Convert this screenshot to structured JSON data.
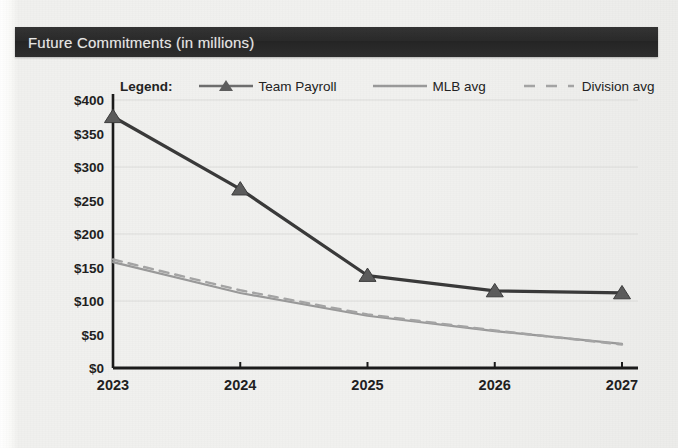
{
  "header": {
    "title": "Future Commitments (in millions)"
  },
  "legend": {
    "label": "Legend:",
    "items": [
      {
        "name": "Team Payroll",
        "style": "line-marker",
        "color": "#3a3a3a"
      },
      {
        "name": "MLB avg",
        "style": "solid",
        "color": "#9a9a9a"
      },
      {
        "name": "Division avg",
        "style": "dashed",
        "color": "#a5a5a5"
      }
    ]
  },
  "chart_data": {
    "type": "line",
    "title": "Future Commitments (in millions)",
    "xlabel": "",
    "ylabel": "",
    "categories": [
      "2023",
      "2024",
      "2025",
      "2026",
      "2027"
    ],
    "x": [
      2023,
      2024,
      2025,
      2026,
      2027
    ],
    "ylim": [
      0,
      400
    ],
    "yticks": [
      0,
      50,
      100,
      150,
      200,
      250,
      300,
      350,
      400
    ],
    "ytick_labels": [
      "$0",
      "$50",
      "$100",
      "$150",
      "$200",
      "$250",
      "$300",
      "$350",
      "$400"
    ],
    "grid": true,
    "grid_interval": 100,
    "legend_position": "top",
    "series": [
      {
        "name": "Team Payroll",
        "values": [
          375,
          267,
          138,
          115,
          112
        ],
        "color": "#3a3a3a",
        "style": "solid",
        "marker": "triangle",
        "width": 3.2
      },
      {
        "name": "MLB avg",
        "values": [
          158,
          112,
          78,
          55,
          36
        ],
        "color": "#9a9a9a",
        "style": "solid",
        "marker": "none",
        "width": 2.2
      },
      {
        "name": "Division avg",
        "values": [
          162,
          116,
          80,
          56,
          35
        ],
        "color": "#a5a5a5",
        "style": "dashed",
        "marker": "none",
        "width": 2.4
      }
    ]
  }
}
